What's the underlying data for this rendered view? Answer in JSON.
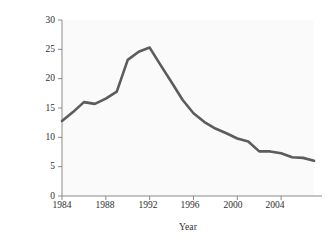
{
  "chart_data": {
    "type": "line",
    "title": "",
    "xlabel": "Year",
    "ylabel": "Cases per 100,000 residents",
    "xlim": [
      1984,
      2007
    ],
    "ylim": [
      0,
      30
    ],
    "xticks": [
      1984,
      1988,
      1992,
      1996,
      2000,
      2004
    ],
    "yticks": [
      0,
      5,
      10,
      15,
      20,
      25,
      30
    ],
    "xtick_labels": [
      "1984",
      "1988",
      "1992",
      "1996",
      "2000",
      "2004"
    ],
    "ytick_labels": [
      "0",
      "5",
      "10",
      "15",
      "20",
      "25",
      "30"
    ],
    "grid": false,
    "legend": null,
    "x": [
      1984,
      1985,
      1986,
      1987,
      1988,
      1989,
      1990,
      1991,
      1992,
      1993,
      1994,
      1995,
      1996,
      1997,
      1998,
      1999,
      2000,
      2001,
      2002,
      2003,
      2004,
      2005,
      2006,
      2007
    ],
    "values": [
      12.8,
      14.3,
      16.0,
      15.7,
      16.6,
      17.8,
      23.2,
      24.6,
      25.3,
      22.3,
      19.4,
      16.4,
      14.1,
      12.6,
      11.5,
      10.7,
      9.8,
      9.3,
      7.6,
      7.6,
      7.3,
      6.6,
      6.5,
      6.0
    ],
    "series": [
      {
        "name": "Cases per 100,000 residents",
        "color": "#5c5c5c",
        "values": [
          12.8,
          14.3,
          16.0,
          15.7,
          16.6,
          17.8,
          23.2,
          24.6,
          25.3,
          22.3,
          19.4,
          16.4,
          14.1,
          12.6,
          11.5,
          10.7,
          9.8,
          9.3,
          7.6,
          7.6,
          7.3,
          6.6,
          6.5,
          6.0
        ]
      }
    ],
    "peak": {
      "x": 1992,
      "y": 25.3
    },
    "start": {
      "x": 1984,
      "y": 12.8
    },
    "end": {
      "x": 2007,
      "y": 6.0
    }
  },
  "style": {
    "plot_background": "#fafafa",
    "line_color": "#5c5c5c",
    "axis_color": "#8a8a8a",
    "text_color": "#2e2e2e"
  }
}
